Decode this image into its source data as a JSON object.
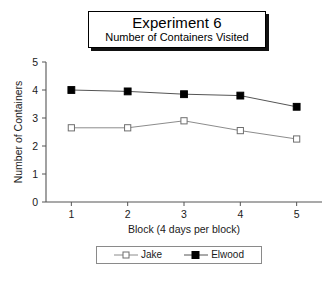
{
  "title": {
    "main": "Experiment 6",
    "sub": "Number of Containers Visited"
  },
  "legend": {
    "items": [
      {
        "label": "Jake",
        "marker": "open-square",
        "color": "#7d7d7d"
      },
      {
        "label": "Elwood",
        "marker": "filled-square",
        "color": "#000000"
      }
    ]
  },
  "chart_data": {
    "type": "line",
    "xlabel": "Block (4 days per block)",
    "ylabel": "Number of Containers",
    "categories": [
      1,
      2,
      3,
      4,
      5
    ],
    "x_tick_labels": [
      "1",
      "2",
      "3",
      "4",
      "5"
    ],
    "y_tick_labels": [
      "0",
      "1",
      "2",
      "3",
      "4",
      "5"
    ],
    "y_ticks": [
      0,
      1,
      2,
      3,
      4,
      5
    ],
    "xlim": [
      0.55,
      5.45
    ],
    "ylim": [
      0,
      5
    ],
    "grid": false,
    "legend_position": "bottom",
    "series": [
      {
        "name": "Jake",
        "values": [
          2.65,
          2.65,
          2.9,
          2.55,
          2.25
        ],
        "marker": "open-square",
        "line_color": "#8c8c8c",
        "marker_fill": "#ffffff",
        "marker_stroke": "#6e6e6e"
      },
      {
        "name": "Elwood",
        "values": [
          4.0,
          3.95,
          3.85,
          3.8,
          3.4
        ],
        "marker": "filled-square",
        "line_color": "#555555",
        "marker_fill": "#000000",
        "marker_stroke": "#000000"
      }
    ]
  }
}
